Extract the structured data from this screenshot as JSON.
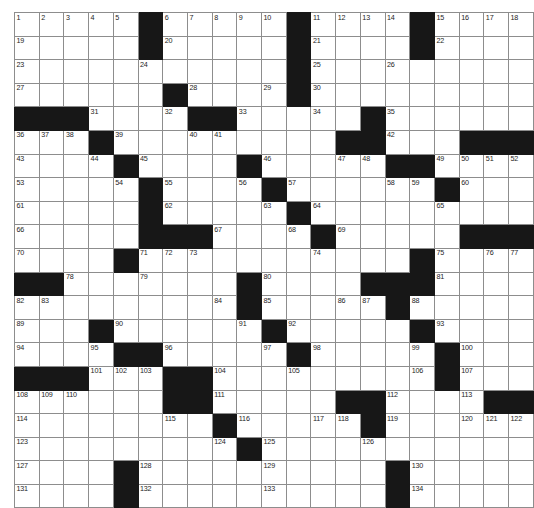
{
  "puzzle": {
    "name": "crossword-grid",
    "rows": 21,
    "cols": 21,
    "colors": {
      "block": "#171717",
      "cell": "#ffffff",
      "gridline": "#8d8d8d",
      "border": "#2b2b2b",
      "number": "#1d1d1d",
      "background": "#ffffff"
    },
    "max_clue_number": 134,
    "grid": [
      [
        {
          "n": "1"
        },
        {
          "n": "2"
        },
        {
          "n": "3"
        },
        {
          "n": "4"
        },
        {
          "n": "5"
        },
        {
          "b": true
        },
        {
          "n": "6"
        },
        {
          "n": "7"
        },
        {
          "n": "8"
        },
        {
          "n": "9"
        },
        {
          "n": "10"
        },
        {
          "b": true
        },
        {
          "n": "11"
        },
        {
          "n": "12"
        },
        {
          "n": "13"
        },
        {
          "n": "14"
        },
        {
          "b": true
        },
        {
          "n": "15"
        },
        {
          "n": "16"
        },
        {
          "n": "17"
        },
        {
          "n": "18"
        }
      ],
      [
        {
          "n": "19"
        },
        {},
        {},
        {},
        {},
        {
          "b": true
        },
        {
          "n": "20"
        },
        {},
        {},
        {},
        {},
        {
          "b": true
        },
        {
          "n": "21"
        },
        {},
        {},
        {},
        {
          "b": true
        },
        {
          "n": "22"
        },
        {},
        {},
        {}
      ],
      [
        {
          "n": "23"
        },
        {},
        {},
        {},
        {},
        {
          "n": "24"
        },
        {},
        {},
        {},
        {},
        {},
        {
          "b": true
        },
        {
          "n": "25"
        },
        {},
        {},
        {
          "n": "26"
        },
        {},
        {},
        {},
        {},
        {}
      ],
      [
        {
          "n": "27"
        },
        {},
        {},
        {},
        {},
        {},
        {
          "b": true
        },
        {
          "n": "28"
        },
        {},
        {},
        {
          "n": "29"
        },
        {
          "b": true
        },
        {
          "n": "30"
        },
        {},
        {},
        {},
        {},
        {},
        {},
        {},
        {}
      ],
      [
        {
          "b": true
        },
        {
          "b": true
        },
        {
          "b": true
        },
        {
          "n": "31"
        },
        {},
        {},
        {
          "n": "32"
        },
        {
          "b": true
        },
        {
          "b": true
        },
        {
          "n": "33"
        },
        {},
        {},
        {
          "n": "34"
        },
        {},
        {
          "b": true
        },
        {
          "n": "35"
        },
        {},
        {},
        {},
        {},
        {}
      ],
      [
        {
          "n": "36"
        },
        {
          "n": "37"
        },
        {
          "n": "38"
        },
        {
          "b": true
        },
        {
          "n": "39"
        },
        {},
        {},
        {
          "n": "40"
        },
        {
          "n": "41"
        },
        {},
        {},
        {},
        {},
        {
          "b": true
        },
        {
          "b": true
        },
        {
          "n": "42"
        },
        {},
        {},
        {
          "b": true
        },
        {
          "b": true
        },
        {
          "b": true
        }
      ],
      [
        {
          "n": "43"
        },
        {},
        {},
        {
          "n": "44"
        },
        {
          "b": true
        },
        {
          "n": "45"
        },
        {},
        {},
        {},
        {
          "b": true
        },
        {
          "n": "46"
        },
        {},
        {},
        {
          "n": "47"
        },
        {
          "n": "48"
        },
        {
          "b": true
        },
        {
          "b": true
        },
        {
          "n": "49"
        },
        {
          "n": "50"
        },
        {
          "n": "51"
        },
        {
          "n": "52"
        }
      ],
      [
        {
          "n": "53"
        },
        {},
        {},
        {},
        {
          "n": "54"
        },
        {
          "b": true
        },
        {
          "n": "55"
        },
        {},
        {},
        {
          "n": "56"
        },
        {
          "b": true
        },
        {
          "n": "57"
        },
        {},
        {},
        {},
        {
          "n": "58"
        },
        {
          "n": "59"
        },
        {
          "b": true
        },
        {
          "n": "60"
        },
        {},
        {}
      ],
      [
        {
          "n": "61"
        },
        {},
        {},
        {},
        {},
        {
          "b": true
        },
        {
          "n": "62"
        },
        {},
        {},
        {},
        {
          "n": "63"
        },
        {
          "b": true
        },
        {
          "n": "64"
        },
        {},
        {},
        {},
        {},
        {
          "n": "65"
        },
        {},
        {},
        {}
      ],
      [
        {
          "n": "66"
        },
        {},
        {},
        {},
        {},
        {
          "b": true
        },
        {
          "b": true
        },
        {
          "b": true
        },
        {
          "n": "67"
        },
        {},
        {},
        {
          "n": "68"
        },
        {
          "b": true
        },
        {
          "n": "69"
        },
        {},
        {},
        {},
        {},
        {
          "b": true
        },
        {
          "b": true
        },
        {
          "b": true
        }
      ],
      [
        {
          "n": "70"
        },
        {},
        {},
        {},
        {
          "b": true
        },
        {
          "n": "71"
        },
        {
          "n": "72"
        },
        {
          "n": "73"
        },
        {},
        {},
        {},
        {},
        {
          "n": "74"
        },
        {},
        {},
        {},
        {
          "b": true
        },
        {
          "n": "75"
        },
        {},
        {
          "n": "76"
        },
        {
          "n": "77"
        }
      ],
      [
        {
          "b": true
        },
        {
          "b": true
        },
        {
          "n": "78"
        },
        {},
        {},
        {
          "n": "79"
        },
        {},
        {},
        {},
        {
          "b": true
        },
        {
          "n": "80"
        },
        {},
        {},
        {},
        {
          "b": true
        },
        {
          "b": true
        },
        {
          "b": true
        },
        {
          "n": "81"
        },
        {},
        {},
        {}
      ],
      [
        {
          "n": "82"
        },
        {
          "n": "83"
        },
        {},
        {},
        {},
        {},
        {},
        {},
        {
          "n": "84"
        },
        {
          "b": true
        },
        {
          "n": "85"
        },
        {},
        {},
        {
          "n": "86"
        },
        {
          "n": "87"
        },
        {
          "b": true
        },
        {
          "n": "88"
        },
        {},
        {},
        {},
        {}
      ],
      [
        {
          "n": "89"
        },
        {},
        {},
        {
          "b": true
        },
        {
          "n": "90"
        },
        {},
        {},
        {},
        {},
        {
          "n": "91"
        },
        {
          "b": true
        },
        {
          "n": "92"
        },
        {},
        {},
        {},
        {},
        {
          "b": true
        },
        {
          "n": "93"
        },
        {},
        {},
        {}
      ],
      [
        {
          "n": "94"
        },
        {},
        {},
        {
          "n": "95"
        },
        {
          "b": true
        },
        {
          "b": true
        },
        {
          "n": "96"
        },
        {},
        {},
        {},
        {
          "n": "97"
        },
        {
          "b": true
        },
        {
          "n": "98"
        },
        {},
        {},
        {},
        {
          "n": "99"
        },
        {
          "b": true
        },
        {
          "n": "100"
        },
        {},
        {}
      ],
      [
        {
          "b": true
        },
        {
          "b": true
        },
        {
          "b": true
        },
        {
          "n": "101"
        },
        {
          "n": "102"
        },
        {
          "n": "103"
        },
        {
          "b": true
        },
        {
          "b": true
        },
        {
          "n": "104"
        },
        {},
        {},
        {
          "n": "105"
        },
        {},
        {},
        {},
        {},
        {
          "n": "106"
        },
        {
          "b": true
        },
        {
          "n": "107"
        },
        {},
        {}
      ],
      [
        {
          "n": "108"
        },
        {
          "n": "109"
        },
        {
          "n": "110"
        },
        {},
        {},
        {},
        {
          "b": true
        },
        {
          "b": true
        },
        {
          "n": "111"
        },
        {},
        {},
        {},
        {},
        {
          "b": true
        },
        {
          "b": true
        },
        {
          "n": "112"
        },
        {},
        {},
        {
          "n": "113"
        },
        {
          "b": true
        },
        {
          "b": true
        }
      ],
      [
        {
          "n": "114"
        },
        {},
        {},
        {},
        {},
        {},
        {
          "n": "115"
        },
        {},
        {
          "b": true
        },
        {
          "n": "116"
        },
        {},
        {},
        {
          "n": "117"
        },
        {
          "n": "118"
        },
        {
          "b": true
        },
        {
          "n": "119"
        },
        {},
        {},
        {
          "n": "120"
        },
        {
          "n": "121"
        },
        {
          "n": "122"
        }
      ],
      [
        {
          "n": "123"
        },
        {},
        {},
        {},
        {},
        {},
        {},
        {},
        {
          "n": "124"
        },
        {
          "b": true
        },
        {
          "n": "125"
        },
        {},
        {},
        {},
        {
          "n": "126"
        },
        {},
        {},
        {},
        {},
        {},
        {}
      ],
      [
        {
          "n": "127"
        },
        {},
        {},
        {},
        {
          "b": true
        },
        {
          "n": "128"
        },
        {},
        {},
        {},
        {},
        {
          "n": "129"
        },
        {},
        {},
        {},
        {},
        {
          "b": true
        },
        {
          "n": "130"
        },
        {},
        {},
        {},
        {}
      ],
      [
        {
          "n": "131"
        },
        {},
        {},
        {},
        {
          "b": true
        },
        {
          "n": "132"
        },
        {},
        {},
        {},
        {},
        {
          "n": "133"
        },
        {},
        {},
        {},
        {},
        {
          "b": true
        },
        {
          "n": "134"
        },
        {},
        {},
        {},
        {}
      ]
    ]
  }
}
